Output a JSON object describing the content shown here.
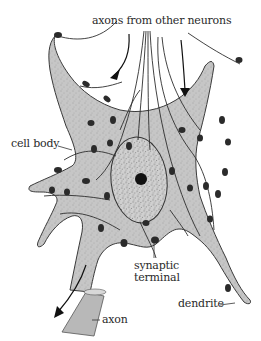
{
  "diagram": {
    "colors": {
      "cell_fill": "#c6c6c6",
      "outline": "#3a3a3a",
      "terminal": "#2b2b2b",
      "nucleus_fill": "#d2d2d2",
      "nucleolus": "#111111",
      "background": "#ffffff"
    },
    "labels": {
      "axons_from_other_neurons": "axons from other neurons",
      "cell_body": "cell body",
      "synaptic": "synaptic",
      "terminal": "terminal",
      "dendrite": "dendrite",
      "axon": "axon"
    },
    "arrows": [
      {
        "name": "incoming-axon-arrow-left",
        "direction": "down-left"
      },
      {
        "name": "incoming-axon-arrow-right",
        "direction": "down"
      },
      {
        "name": "outgoing-axon-arrow",
        "direction": "down-left"
      }
    ]
  }
}
